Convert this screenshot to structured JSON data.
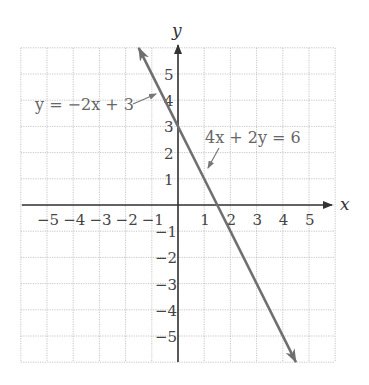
{
  "chart_data": {
    "type": "line",
    "title": "",
    "xlabel": "x",
    "ylabel": "y",
    "xlim": [
      -6,
      6
    ],
    "ylim": [
      -6,
      6
    ],
    "grid": true,
    "x_ticks": [
      "-5",
      "-4",
      "-3",
      "-2",
      "-1",
      "1",
      "2",
      "3",
      "4",
      "5"
    ],
    "y_ticks": [
      "5",
      "4",
      "3",
      "2",
      "1",
      "-1",
      "-2",
      "-3",
      "-4",
      "-5"
    ],
    "series": [
      {
        "name": "y = -2x + 3",
        "equivalent": "4x + 2y = 6",
        "slope": -2,
        "intercept": 3,
        "x": [
          -1.5,
          0,
          1.5,
          4.5
        ],
        "y": [
          6,
          3,
          0,
          -6
        ]
      }
    ],
    "annotations": [
      {
        "text": "y = −2x + 3",
        "points_to": [
          -0.5,
          4
        ]
      },
      {
        "text": "4x + 2y = 6",
        "points_to": [
          1.2,
          0.6
        ]
      }
    ],
    "line_color": "#6f6f6f"
  },
  "labels": {
    "x_axis": "x",
    "y_axis": "y",
    "eq1": "y = −2x + 3",
    "eq2": "4x + 2y = 6"
  }
}
